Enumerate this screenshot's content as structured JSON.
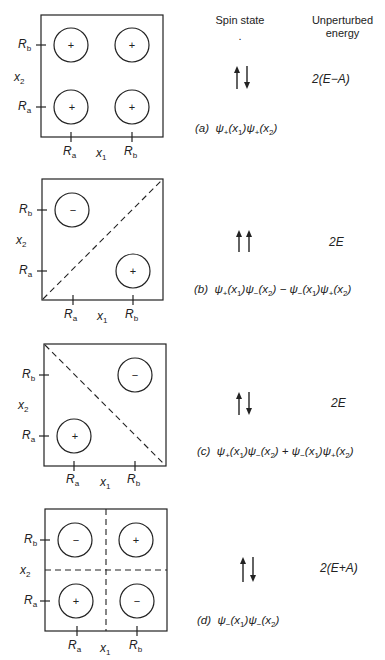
{
  "header": {
    "spin_state": "Spin state",
    "energy_line1": "Unperturbed",
    "energy_line2": "energy",
    "dot": "."
  },
  "axes": {
    "x_label": "x",
    "x_sub": "1",
    "y_label": "x",
    "y_sub": "2",
    "tick_a": "R",
    "tick_a_sub": "a",
    "tick_b": "R",
    "tick_b_sub": "b"
  },
  "panels": [
    {
      "id": "a",
      "tag": "(a)",
      "spin": "up-down",
      "energy": "2(E−A)",
      "wavefunction": "ψ₊(x₁)ψ₊(x₂)",
      "wavefunction_parts": [
        "ψ",
        "+",
        "(x",
        "1",
        ")ψ",
        "+",
        "(x",
        "2",
        ")"
      ],
      "lobes": [
        {
          "pos": "a,b",
          "sign": "+"
        },
        {
          "pos": "b,b",
          "sign": "+"
        },
        {
          "pos": "a,a",
          "sign": "+"
        },
        {
          "pos": "b,a",
          "sign": "+"
        }
      ],
      "nodal_lines": []
    },
    {
      "id": "b",
      "tag": "(b)",
      "spin": "up-up",
      "energy": "2E",
      "wavefunction": "ψ₊(x₁)ψ₋(x₂) − ψ₋(x₁)ψ₊(x₂)",
      "lobes": [
        {
          "pos": "a,b",
          "sign": "−"
        },
        {
          "pos": "b,a",
          "sign": "+"
        }
      ],
      "nodal_lines": [
        "diagonal-up"
      ]
    },
    {
      "id": "c",
      "tag": "(c)",
      "spin": "up-down",
      "energy": "2E",
      "wavefunction": "ψ₊(x₁)ψ₋(x₂) + ψ₋(x₁)ψ₊(x₂)",
      "lobes": [
        {
          "pos": "b,b",
          "sign": "−"
        },
        {
          "pos": "a,a",
          "sign": "+"
        }
      ],
      "nodal_lines": [
        "diagonal-down"
      ]
    },
    {
      "id": "d",
      "tag": "(d)",
      "spin": "up-down",
      "energy": "2(E+A)",
      "wavefunction": "ψ₋(x₁)ψ₋(x₂)",
      "lobes": [
        {
          "pos": "a,b",
          "sign": "−"
        },
        {
          "pos": "b,b",
          "sign": "+"
        },
        {
          "pos": "a,a",
          "sign": "+"
        },
        {
          "pos": "b,a",
          "sign": "−"
        }
      ],
      "nodal_lines": [
        "vertical",
        "horizontal"
      ]
    }
  ]
}
